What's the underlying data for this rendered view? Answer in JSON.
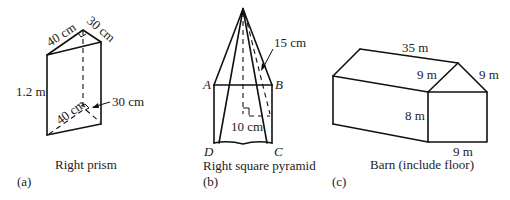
{
  "figures": [
    {
      "id": "a",
      "letter": "(a)",
      "caption": "Right prism",
      "labels": {
        "top_left_edge": "40 cm",
        "top_right_edge": "30 cm",
        "height": "1.2 m",
        "bottom_left_edge": "40 cm",
        "bottom_right_edge": "30 cm"
      }
    },
    {
      "id": "b",
      "letter": "(b)",
      "caption": "Right square pyramid",
      "labels": {
        "slant_height": "15 cm",
        "base_side": "10 cm",
        "vertex_a": "A",
        "vertex_b": "B",
        "vertex_c": "C",
        "vertex_d": "D"
      }
    },
    {
      "id": "c",
      "letter": "(c)",
      "caption": "Barn (include floor)",
      "labels": {
        "length": "35 m",
        "roof_left": "9 m",
        "roof_right": "9 m",
        "wall_height": "8 m",
        "width": "9 m"
      }
    }
  ],
  "colors": {
    "line": "#111111",
    "text": "#222222",
    "background": "#ffffff"
  }
}
